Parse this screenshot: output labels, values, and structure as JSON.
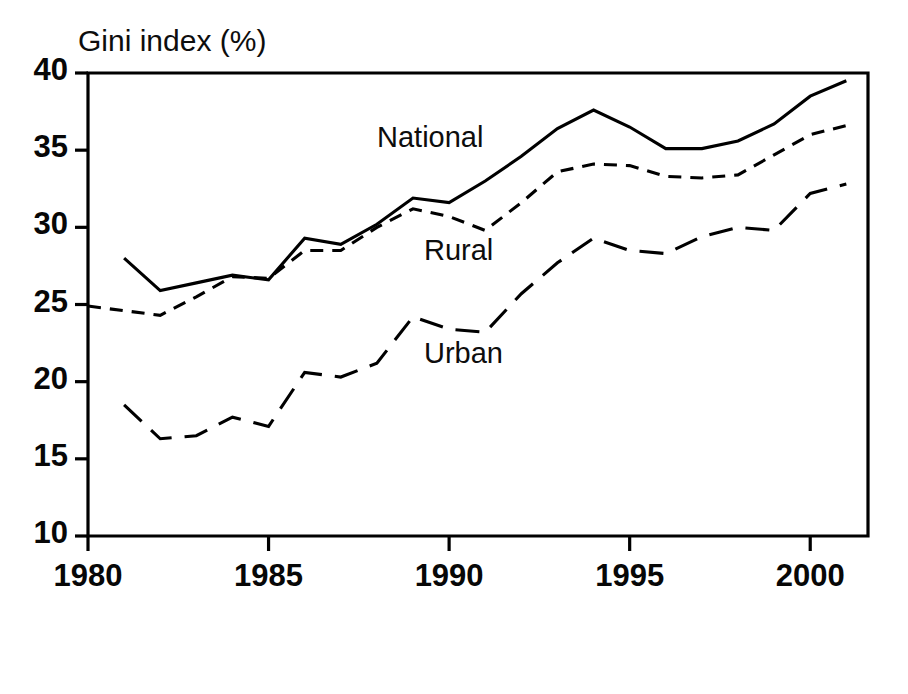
{
  "chart_data": {
    "type": "line",
    "title": "",
    "ylabel": "Gini index (%)",
    "xlabel": "",
    "xlim": [
      1980,
      2001.6
    ],
    "ylim": [
      10,
      40
    ],
    "xticks": [
      1980,
      1985,
      1990,
      1995,
      2000
    ],
    "xtick_labels": [
      "1980",
      "1985",
      "1990",
      "1995",
      "2000"
    ],
    "yticks": [
      10,
      15,
      20,
      25,
      30,
      35,
      40
    ],
    "ytick_labels": [
      "10",
      "15",
      "20",
      "25",
      "30",
      "35",
      "40"
    ],
    "grid": false,
    "legend_position": "inline-annotations",
    "series": [
      {
        "name": "National",
        "style": "solid",
        "label_x": 1989.0,
        "label_y": 35.6,
        "x": [
          1981,
          1982,
          1983,
          1984,
          1985,
          1986,
          1987,
          1988,
          1989,
          1990,
          1991,
          1992,
          1993,
          1994,
          1995,
          1996,
          1997,
          1998,
          1999,
          2000,
          2001
        ],
        "values": [
          28.0,
          25.9,
          26.4,
          26.9,
          26.6,
          29.3,
          28.9,
          30.2,
          31.9,
          31.6,
          33.0,
          34.6,
          36.4,
          37.6,
          36.5,
          35.1,
          35.1,
          35.6,
          36.7,
          38.5,
          39.5
        ]
      },
      {
        "name": "Rural",
        "style": "short-dash",
        "label_x": 1990.3,
        "label_y": 28.3,
        "x": [
          1980,
          1981,
          1982,
          1983,
          1984,
          1985,
          1986,
          1987,
          1988,
          1989,
          1990,
          1991,
          1992,
          1993,
          1994,
          1995,
          1996,
          1997,
          1998,
          1999,
          2000,
          2001
        ],
        "values": [
          24.9,
          24.6,
          24.3,
          25.5,
          26.8,
          26.7,
          28.5,
          28.5,
          30.0,
          31.2,
          30.7,
          29.8,
          31.6,
          33.6,
          34.1,
          34.0,
          33.3,
          33.2,
          33.4,
          34.7,
          36.0,
          36.6
        ]
      },
      {
        "name": "Urban",
        "style": "long-dash",
        "label_x": 1990.3,
        "label_y": 21.6,
        "x": [
          1981,
          1982,
          1983,
          1984,
          1985,
          1986,
          1987,
          1988,
          1989,
          1990,
          1991,
          1992,
          1993,
          1994,
          1995,
          1996,
          1997,
          1998,
          1999,
          2000,
          2001
        ],
        "values": [
          18.5,
          16.3,
          16.5,
          17.7,
          17.1,
          20.6,
          20.3,
          21.2,
          24.2,
          23.4,
          23.2,
          25.7,
          27.7,
          29.3,
          28.5,
          28.3,
          29.4,
          30.0,
          29.8,
          32.2,
          32.8
        ]
      }
    ]
  },
  "axes": {
    "ylabel_text": "Gini index (%)"
  }
}
